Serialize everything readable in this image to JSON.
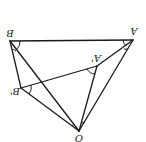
{
  "diagram": {
    "rotation_deg": 180,
    "stroke_color": "#1a1a1a",
    "points": [
      {
        "id": "B",
        "label": "B",
        "x": 10,
        "y": 41,
        "lx": 10,
        "ly": 34
      },
      {
        "id": "A",
        "label": "A",
        "x": 133,
        "y": 40,
        "lx": 134,
        "ly": 32
      },
      {
        "id": "A1",
        "label": "A'",
        "x": 97,
        "y": 66,
        "lx": 96,
        "ly": 59
      },
      {
        "id": "B1",
        "label": "B'",
        "x": 21,
        "y": 88,
        "lx": 15,
        "ly": 92
      },
      {
        "id": "O",
        "label": "O",
        "x": 79,
        "y": 131,
        "lx": 79,
        "ly": 139
      }
    ],
    "segments": [
      [
        "B",
        "A"
      ],
      [
        "B",
        "B1"
      ],
      [
        "B",
        "O"
      ],
      [
        "B1",
        "A1"
      ],
      [
        "B1",
        "O"
      ],
      [
        "A1",
        "O"
      ],
      [
        "A1",
        "A"
      ],
      [
        "A",
        "O"
      ]
    ],
    "labels": {
      "B": "B",
      "A": "A",
      "A1": "A'",
      "B1": "B'",
      "O": "O"
    }
  }
}
